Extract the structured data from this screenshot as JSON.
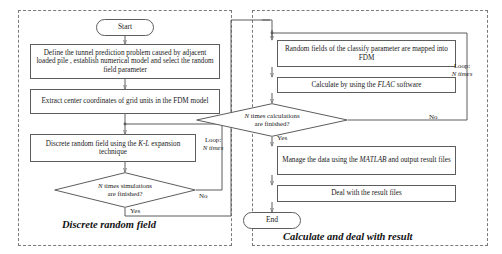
{
  "figure": {
    "type": "flowchart",
    "panels": [
      {
        "id": "left",
        "caption": "Discrete random field",
        "loop_label_line1": "Loop:",
        "loop_label_line2": "N times",
        "nodes": [
          {
            "id": "start",
            "shape": "terminal",
            "text": "Start"
          },
          {
            "id": "define",
            "shape": "process",
            "text": "Define the tunnel prediction problem caused by adjacent loaded pile , establish numerical model and select the random field parameter"
          },
          {
            "id": "extract",
            "shape": "process",
            "text": "Extract center coordinates of grid units in the FDM model"
          },
          {
            "id": "discrete",
            "shape": "process",
            "text_pre": "Discrete random field  using the ",
            "text_em": "K-L",
            "text_post": " expansion technique"
          },
          {
            "id": "decision-sim",
            "shape": "decision",
            "line1_em": "N",
            "line1_post": " times simulations",
            "line2": "are finished?"
          }
        ],
        "edge_labels": {
          "no": "No",
          "yes": "Yes"
        }
      },
      {
        "id": "right",
        "caption": "Calculate and deal with result",
        "loop_label_line1": "Loop:",
        "loop_label_line2": "N times",
        "nodes": [
          {
            "id": "map",
            "shape": "process",
            "text": "Random fields of the classify parameter are mapped into FDM"
          },
          {
            "id": "calc",
            "shape": "process",
            "text_pre": "Calculate by using the ",
            "text_em": "FLAC",
            "text_post": " software"
          },
          {
            "id": "decision-calc",
            "shape": "decision",
            "line1_em": "N",
            "line1_post": " times calculations",
            "line2": "are finished?"
          },
          {
            "id": "manage",
            "shape": "process",
            "text_pre": "Manage the data using the ",
            "text_em": "MATLAB",
            "text_post": " and output result files"
          },
          {
            "id": "deal",
            "shape": "process",
            "text": "Deal with the result files"
          },
          {
            "id": "end",
            "shape": "terminal",
            "text": "End"
          }
        ],
        "edge_labels": {
          "no": "No",
          "yes": "Yes"
        }
      }
    ],
    "colors": {
      "stroke": "#5d5d5d",
      "panel_border": "#7a7a7a",
      "text": "#1a1a1a",
      "background": "#ffffff"
    }
  }
}
